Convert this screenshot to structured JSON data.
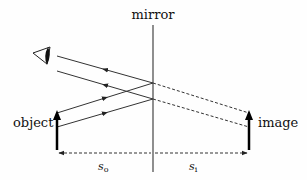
{
  "diagram": {
    "labels": {
      "mirror": "mirror",
      "object": "object",
      "image": "image",
      "object_distance": "s",
      "object_distance_sub": "o",
      "image_distance": "s",
      "image_distance_sub": "i"
    },
    "colors": {
      "line": "#333333",
      "arrow": "#000000",
      "background": "#fefefe"
    },
    "elements": [
      "mirror-line",
      "eye-icon",
      "object-arrow",
      "image-arrow",
      "incident-rays",
      "reflected-rays",
      "virtual-rays",
      "distance-arrows"
    ]
  }
}
